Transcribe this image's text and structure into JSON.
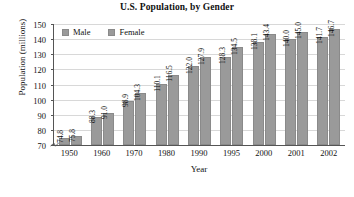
{
  "chart_data": {
    "type": "bar",
    "title": "U.S. Population, by Gender",
    "xlabel": "Year",
    "ylabel": "Population (millions)",
    "categories": [
      "1950",
      "1960",
      "1970",
      "1980",
      "1990",
      "1995",
      "2000",
      "2001",
      "2002"
    ],
    "series": [
      {
        "name": "Male",
        "color": "#9a9a9a",
        "values": [
          74.8,
          88.3,
          98.9,
          110.1,
          122.0,
          128.3,
          138.1,
          140.0,
          141.7
        ],
        "labels": [
          "74.8",
          "88.3",
          "98.9",
          "110.1",
          "122.0",
          "128.3",
          "138.1",
          "140.0",
          "141.7"
        ]
      },
      {
        "name": "Female",
        "color": "#9a9a9a",
        "values": [
          75.8,
          91.0,
          104.3,
          116.5,
          127.9,
          134.5,
          143.4,
          145.0,
          146.7
        ],
        "labels": [
          "75.8",
          "91.0",
          "104.3",
          "116.5",
          "127.9",
          "134.5",
          "143.4",
          "145.0",
          "146.7"
        ]
      }
    ],
    "ylim": [
      70,
      150
    ],
    "yticks": [
      70,
      80,
      90,
      100,
      110,
      120,
      130,
      140,
      150
    ],
    "ytick_labels": [
      "70",
      "80",
      "90",
      "100",
      "110",
      "120",
      "130",
      "140",
      "150"
    ],
    "grid": true,
    "axis_break": true,
    "legend_position": "top-left-inside"
  },
  "legend": {
    "items": [
      {
        "label": "Male"
      },
      {
        "label": "Female"
      }
    ]
  },
  "colors": {
    "bar_fill": "#9a9a9a",
    "bar_stroke": "#8a8a8a",
    "gridline": "#d8d8d8",
    "axis": "#555555",
    "text": "#111111",
    "background": "#ffffff"
  }
}
